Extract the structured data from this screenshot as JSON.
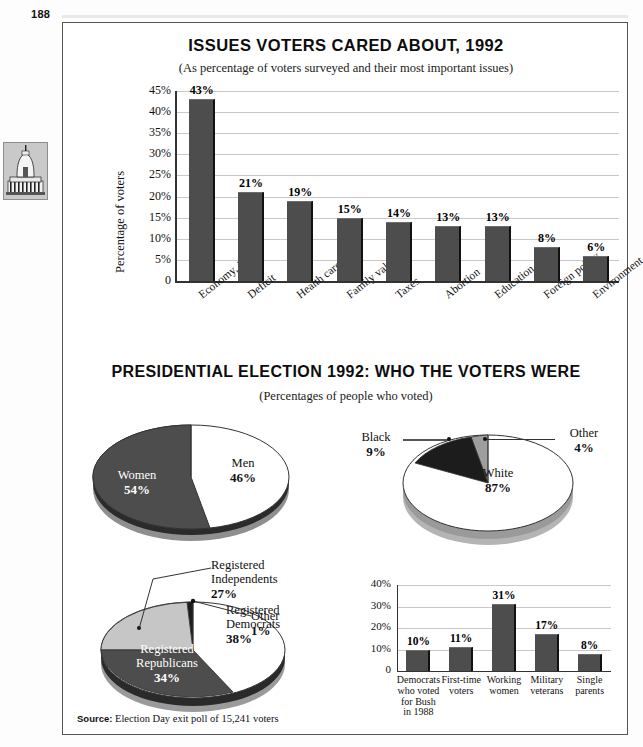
{
  "page": {
    "number": "188",
    "icon_name": "capitol-building-icon"
  },
  "source": {
    "label": "Source:",
    "text": "Election Day exit poll of 15,241 voters"
  },
  "figure1": {
    "title": "ISSUES VOTERS CARED ABOUT, 1992",
    "subtitle": "(As percentage of voters surveyed and their most important issues)"
  },
  "figure2": {
    "title": "PRESIDENTIAL ELECTION 1992: WHO THE VOTERS WERE",
    "subtitle": "(Percentages of people who voted)"
  },
  "chart_data": [
    {
      "id": "issues-bar-chart",
      "type": "bar",
      "title": "ISSUES VOTERS CARED ABOUT, 1992",
      "subtitle": "(As percentage of voters surveyed and their most important issues)",
      "xlabel": "",
      "ylabel": "Percentage of voters",
      "ylim": [
        0,
        45
      ],
      "yticks": [
        "0",
        "5%",
        "10%",
        "15%",
        "20%",
        "25%",
        "30%",
        "35%",
        "40%",
        "45%"
      ],
      "grid": true,
      "categories": [
        "Economy, jobs",
        "Deficit",
        "Health care",
        "Family values",
        "Taxes",
        "Abortion",
        "Education",
        "Foreign policy",
        "Environment"
      ],
      "values": [
        43,
        21,
        19,
        15,
        14,
        13,
        13,
        8,
        6
      ],
      "value_labels": [
        "43%",
        "21%",
        "19%",
        "15%",
        "14%",
        "13%",
        "13%",
        "8%",
        "6%"
      ],
      "bar_color": "#4d4d4d"
    },
    {
      "id": "gender-pie",
      "type": "pie",
      "title": "",
      "labels": [
        "Men",
        "Women"
      ],
      "values": [
        46,
        54
      ],
      "value_labels": [
        "46%",
        "54%"
      ],
      "colors": [
        "#ffffff",
        "#4d4d4d"
      ]
    },
    {
      "id": "race-pie",
      "type": "pie",
      "title": "",
      "labels": [
        "White",
        "Black",
        "Other"
      ],
      "values": [
        87,
        9,
        4
      ],
      "value_labels": [
        "87%",
        "9%",
        "4%"
      ],
      "colors": [
        "#ffffff",
        "#1c1c1c",
        "#9e9e9e"
      ]
    },
    {
      "id": "registration-pie",
      "type": "pie",
      "title": "",
      "labels": [
        "Registered Democrats",
        "Registered Republicans",
        "Registered Independents",
        "Other"
      ],
      "values": [
        38,
        34,
        27,
        1
      ],
      "value_labels": [
        "38%",
        "34%",
        "27%",
        "1%"
      ],
      "colors": [
        "#ffffff",
        "#4d4d4d",
        "#c6c6c6",
        "#1c1c1c"
      ]
    },
    {
      "id": "groups-bar-chart",
      "type": "bar",
      "title": "",
      "xlabel": "",
      "ylabel": "",
      "ylim": [
        0,
        40
      ],
      "yticks": [
        "0",
        "10%",
        "20%",
        "30%",
        "40%"
      ],
      "grid": true,
      "categories": [
        "Democrats who voted for Bush in 1988",
        "First-time voters",
        "Working women",
        "Military veterans",
        "Single parents"
      ],
      "values": [
        10,
        11,
        31,
        17,
        8
      ],
      "value_labels": [
        "10%",
        "11%",
        "31%",
        "17%",
        "8%"
      ],
      "bar_color": "#4d4d4d"
    }
  ],
  "labels": {
    "men": "Men",
    "men_pct": "46%",
    "women": "Women",
    "women_pct": "54%",
    "white": "White",
    "white_pct": "87%",
    "black": "Black",
    "black_pct": "9%",
    "other_race": "Other",
    "other_race_pct": "4%",
    "reg_dem_l1": "Registered",
    "reg_dem_l2": "Democrats",
    "reg_dem_pct": "38%",
    "reg_rep_l1": "Registered",
    "reg_rep_l2": "Republicans",
    "reg_rep_pct": "34%",
    "reg_ind_l1": "Registered",
    "reg_ind_l2": "Independents",
    "reg_ind_pct": "27%",
    "reg_other": "Other",
    "reg_other_pct": "1%"
  }
}
